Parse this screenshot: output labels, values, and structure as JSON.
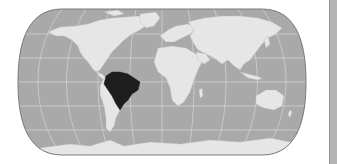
{
  "map": {
    "projection": "robinson-like",
    "highlighted_country": "Brazil",
    "colors": {
      "ocean": "#a9a9a9",
      "land": "#e6e6e6",
      "highlight": "#1e1e1e",
      "graticule": "#d0d0d0",
      "outline": "#7a7a7a",
      "side_bar": "#b4b4b4"
    }
  }
}
